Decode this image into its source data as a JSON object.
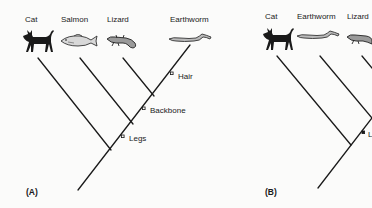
{
  "panels": [
    {
      "id": "A",
      "label": "(A)",
      "taxa": [
        "Cat",
        "Salmon",
        "Lizard",
        "Earthworm"
      ],
      "traits": [
        "Hair",
        "Backbone",
        "Legs"
      ]
    },
    {
      "id": "B",
      "label": "(B)",
      "taxa": [
        "Cat",
        "Earthworm",
        "Lizard"
      ],
      "traits": [
        "L"
      ]
    }
  ],
  "icons": {
    "cat": "cat-silhouette-icon",
    "salmon": "fish-icon",
    "lizard": "lizard-icon",
    "earthworm": "worm-icon"
  },
  "colors": {
    "line": "#1a1a1a",
    "background": "#fbfbfa"
  }
}
